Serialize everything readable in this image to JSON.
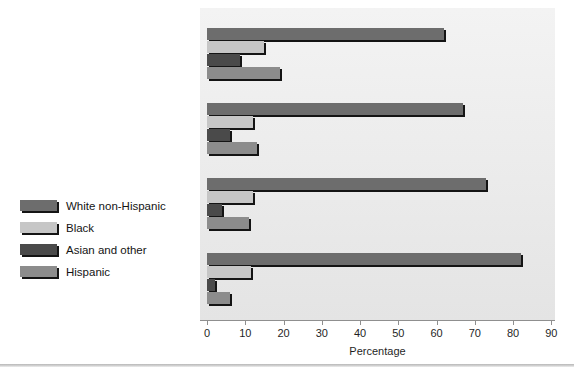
{
  "chart_data": {
    "type": "bar",
    "orientation": "horizontal",
    "title": "",
    "xlabel": "Percentage",
    "ylabel": "",
    "xlim": [
      0,
      90
    ],
    "xticks": [
      0,
      10,
      20,
      30,
      40,
      50,
      60,
      70,
      80,
      90
    ],
    "grid": false,
    "legend_position": "left-outside",
    "categories": [
      "2025",
      "2015",
      "1998",
      "1980"
    ],
    "series": [
      {
        "name": "White non-Hispanic",
        "color": "#6d6d6d",
        "values": [
          62,
          67,
          73,
          82
        ]
      },
      {
        "name": "Black",
        "color": "#c6c6c6",
        "values": [
          15,
          12,
          12,
          11.5
        ]
      },
      {
        "name": "Asian and other",
        "color": "#4a4a4a",
        "values": [
          8.5,
          6,
          4,
          2
        ]
      },
      {
        "name": "Hispanic",
        "color": "#8c8c8c",
        "values": [
          19,
          13,
          11,
          6
        ]
      }
    ]
  },
  "legend": {
    "items": [
      {
        "label": "White non-Hispanic",
        "color": "#6d6d6d"
      },
      {
        "label": "Black",
        "color": "#c6c6c6"
      },
      {
        "label": "Asian and other",
        "color": "#4a4a4a"
      },
      {
        "label": "Hispanic",
        "color": "#8c8c8c"
      }
    ]
  },
  "axis": {
    "x_title": "Percentage",
    "tick_labels": [
      "0",
      "10",
      "20",
      "30",
      "40",
      "50",
      "60",
      "70",
      "80",
      "90"
    ]
  },
  "group_labels": [
    "2025",
    "2015",
    "1998",
    "1980"
  ],
  "colors": {
    "plot_background": "#ededed",
    "page_background": "#ffffff",
    "bar_shadow": "#141414",
    "axis": "#8f8f8f",
    "text": "#141414"
  }
}
